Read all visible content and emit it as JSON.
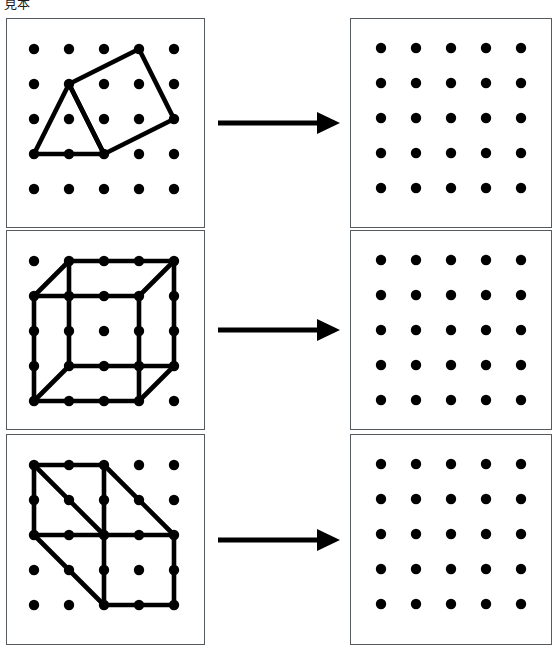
{
  "document": {
    "title": "見本",
    "type": "geometry-worksheet",
    "page_width": 557,
    "page_height": 651,
    "background_color": "#ffffff",
    "ink_color": "#000000",
    "panel_border_color": "#555a5e"
  },
  "grid": {
    "columns": 5,
    "rows": 5,
    "spacing": 35,
    "dot_radius": 5.2,
    "dot_color": "#000000",
    "origin_left_x": 27,
    "origin_left_y": 30,
    "origin_right_x": 30,
    "origin_right_y": 29
  },
  "arrow": {
    "name": "right-arrow",
    "shaft_start_x": 13,
    "shaft_end_x": 112,
    "shaft_thickness": 5,
    "head_length": 23,
    "head_half_height": 11,
    "color": "#000000"
  },
  "rows": [
    {
      "index": 1,
      "top": 18,
      "height": 210,
      "left_panel": {
        "name": "figure-panel-triangle-square",
        "caption": "triangle and tilted square on 5x5 dot grid",
        "shapes": [
          {
            "name": "triangle",
            "closed": true,
            "points": [
              [
                0,
                3
              ],
              [
                1,
                1
              ],
              [
                2,
                3
              ]
            ]
          },
          {
            "name": "tilted-square",
            "closed": true,
            "points": [
              [
                1,
                1
              ],
              [
                3,
                0
              ],
              [
                4,
                2
              ],
              [
                2,
                3
              ]
            ]
          }
        ]
      },
      "right_panel": {
        "name": "answer-panel-blank-grid",
        "caption": "blank 5x5 dot grid",
        "shapes": []
      }
    },
    {
      "index": 2,
      "top": 230,
      "height": 200,
      "left_panel": {
        "name": "figure-panel-cube",
        "caption": "cube drawn in oblique projection on 5x5 dot grid",
        "shapes": [
          {
            "name": "cube-front-face",
            "closed": true,
            "points": [
              [
                0,
                1
              ],
              [
                3,
                1
              ],
              [
                3,
                4
              ],
              [
                0,
                4
              ]
            ]
          },
          {
            "name": "cube-back-face",
            "closed": true,
            "points": [
              [
                1,
                0
              ],
              [
                4,
                0
              ],
              [
                4,
                3
              ],
              [
                1,
                3
              ]
            ]
          },
          {
            "name": "cube-connector-top-left",
            "closed": false,
            "points": [
              [
                0,
                1
              ],
              [
                1,
                0
              ]
            ]
          },
          {
            "name": "cube-connector-top-right",
            "closed": false,
            "points": [
              [
                3,
                1
              ],
              [
                4,
                0
              ]
            ]
          },
          {
            "name": "cube-connector-bottom-right",
            "closed": false,
            "points": [
              [
                3,
                4
              ],
              [
                4,
                3
              ]
            ]
          },
          {
            "name": "cube-connector-bottom-left",
            "closed": false,
            "points": [
              [
                0,
                4
              ],
              [
                1,
                3
              ]
            ]
          }
        ]
      },
      "right_panel": {
        "name": "answer-panel-blank-grid",
        "caption": "blank 5x5 dot grid",
        "shapes": []
      }
    },
    {
      "index": 3,
      "top": 434,
      "height": 211,
      "left_panel": {
        "name": "figure-panel-rectangular-prism",
        "caption": "rectangular prism drawn in oblique projection on 5x5 dot grid",
        "shapes": [
          {
            "name": "prism-front-face",
            "closed": true,
            "points": [
              [
                2,
                2
              ],
              [
                4,
                2
              ],
              [
                4,
                4
              ],
              [
                2,
                4
              ]
            ]
          },
          {
            "name": "prism-back-face",
            "closed": true,
            "points": [
              [
                0,
                0
              ],
              [
                2,
                0
              ],
              [
                2,
                2
              ],
              [
                0,
                2
              ]
            ]
          },
          {
            "name": "prism-connector-top-left",
            "closed": false,
            "points": [
              [
                0,
                0
              ],
              [
                2,
                2
              ]
            ]
          },
          {
            "name": "prism-connector-top-right",
            "closed": false,
            "points": [
              [
                2,
                0
              ],
              [
                4,
                2
              ]
            ]
          },
          {
            "name": "prism-connector-bottom-left",
            "closed": false,
            "points": [
              [
                0,
                2
              ],
              [
                2,
                4
              ]
            ]
          }
        ]
      },
      "right_panel": {
        "name": "answer-panel-blank-grid",
        "caption": "blank 5x5 dot grid",
        "shapes": []
      }
    }
  ]
}
